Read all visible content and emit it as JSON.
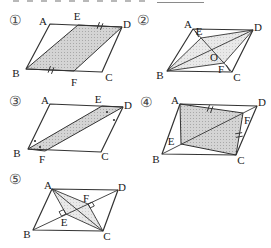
{
  "style": {
    "line_color": "#333333",
    "label_color": "#1a1a1a",
    "number_color": "#4a4a4a",
    "shade_dark_bg": "#d4d4d4",
    "shade_dark_dot": "#a8a8a8",
    "shade_light_bg": "#e9e9e9",
    "shade_light_dot": "#cccccc"
  },
  "top_edge_fragments": {
    "dashes": [
      {
        "x": 13,
        "y": 0,
        "w": 6,
        "h": 2
      },
      {
        "x": 27,
        "y": 0,
        "w": 6,
        "h": 2
      },
      {
        "x": 41,
        "y": 0,
        "w": 6,
        "h": 2
      },
      {
        "x": 55,
        "y": 0,
        "w": 6,
        "h": 2
      },
      {
        "x": 69,
        "y": 0,
        "w": 6,
        "h": 2
      },
      {
        "x": 83,
        "y": 0,
        "w": 6,
        "h": 2
      },
      {
        "x": 97,
        "y": 0,
        "w": 6,
        "h": 2
      },
      {
        "x": 111,
        "y": 0,
        "w": 6,
        "h": 2
      },
      {
        "x": 125,
        "y": 0,
        "w": 6,
        "h": 2
      },
      {
        "x": 139,
        "y": 0,
        "w": 6,
        "h": 2
      }
    ],
    "underline": {
      "x": 157,
      "y": 2,
      "w": 47,
      "h": 1
    }
  },
  "figures": [
    {
      "id": "1",
      "number_label": "①",
      "number_pos": {
        "x": 15,
        "y": 20
      },
      "polygons": [
        {
          "name": "shaded-region",
          "points": "78,25 122,27 74,71 26,69",
          "fill": "dark",
          "stroke": true,
          "sw": 1
        },
        {
          "name": "parallelogram-outline",
          "points": "50,24 122,27 102,72 26,69",
          "fill": "none",
          "stroke": true,
          "sw": 1.2
        }
      ],
      "lines": [],
      "marks": [
        {
          "type": "tick2",
          "x": 100,
          "y": 26,
          "angle": 20
        },
        {
          "type": "tick2",
          "x": 51,
          "y": 70,
          "angle": 20
        }
      ],
      "labels": [
        {
          "text": "A",
          "x": 43,
          "y": 21
        },
        {
          "text": "E",
          "x": 77,
          "y": 16
        },
        {
          "text": "D",
          "x": 127,
          "y": 24
        },
        {
          "text": "B",
          "x": 16,
          "y": 73
        },
        {
          "text": "F",
          "x": 74,
          "y": 82
        },
        {
          "text": "C",
          "x": 109,
          "y": 77
        }
      ]
    },
    {
      "id": "2",
      "number_label": "②",
      "number_pos": {
        "x": 143,
        "y": 20
      },
      "polygons": [
        {
          "name": "shaded-region",
          "points": "167,71 201,38 253,30 224,63",
          "fill": "light",
          "stroke": true,
          "sw": 0.9
        },
        {
          "name": "parallelogram-outline",
          "points": "193,29 253,30 232,72 167,71",
          "fill": "none",
          "stroke": true,
          "sw": 1.2
        }
      ],
      "lines": [
        {
          "name": "diagonal-AC",
          "x1": 193,
          "y1": 29,
          "x2": 232,
          "y2": 72,
          "sw": 0.9
        },
        {
          "name": "diagonal-BD",
          "x1": 167,
          "y1": 71,
          "x2": 253,
          "y2": 30,
          "sw": 0.9
        }
      ],
      "marks": [
        {
          "type": "tick1",
          "x": 197,
          "y": 34,
          "angle": -30
        },
        {
          "type": "tick1",
          "x": 228,
          "y": 68,
          "angle": -30
        }
      ],
      "labels": [
        {
          "text": "A",
          "x": 188,
          "y": 24
        },
        {
          "text": "E",
          "x": 199,
          "y": 31
        },
        {
          "text": "D",
          "x": 258,
          "y": 27
        },
        {
          "text": "O",
          "x": 214,
          "y": 57
        },
        {
          "text": "F",
          "x": 221,
          "y": 69
        },
        {
          "text": "B",
          "x": 160,
          "y": 75
        },
        {
          "text": "C",
          "x": 237,
          "y": 77
        }
      ]
    },
    {
      "id": "3",
      "number_label": "③",
      "number_pos": {
        "x": 15,
        "y": 101
      },
      "polygons": [
        {
          "name": "shaded-region",
          "points": "28,149 102,106 123,107 45,151",
          "fill": "dark",
          "stroke": true,
          "sw": 1
        },
        {
          "name": "parallelogram-outline",
          "points": "50,104 123,107 101,152 28,149",
          "fill": "none",
          "stroke": true,
          "sw": 1.2
        }
      ],
      "lines": [],
      "marks": [
        {
          "type": "dot",
          "x": 35,
          "y": 141
        },
        {
          "type": "dot",
          "x": 40,
          "y": 147
        },
        {
          "type": "dot",
          "x": 107,
          "y": 112
        },
        {
          "type": "dot",
          "x": 114,
          "y": 120
        }
      ],
      "labels": [
        {
          "text": "A",
          "x": 45,
          "y": 100
        },
        {
          "text": "E",
          "x": 98,
          "y": 99
        },
        {
          "text": "D",
          "x": 128,
          "y": 105
        },
        {
          "text": "B",
          "x": 17,
          "y": 153
        },
        {
          "text": "F",
          "x": 42,
          "y": 159
        },
        {
          "text": "C",
          "x": 105,
          "y": 156
        }
      ]
    },
    {
      "id": "4",
      "number_label": "④",
      "number_pos": {
        "x": 146,
        "y": 102
      },
      "polygons": [
        {
          "name": "shaded-region",
          "points": "180,104 243,113 236,155 181,144",
          "fill": "dark",
          "stroke": true,
          "sw": 1
        },
        {
          "name": "parallelogram-outline",
          "points": "180,104 257,106 236,155 162,154",
          "fill": "none",
          "stroke": true,
          "sw": 1.2
        }
      ],
      "lines": [
        {
          "name": "diagonal-BD",
          "x1": 162,
          "y1": 154,
          "x2": 257,
          "y2": 106,
          "sw": 0.9
        }
      ],
      "marks": [
        {
          "type": "tick2",
          "x": 210,
          "y": 109,
          "angle": 20
        },
        {
          "type": "tick2",
          "x": 239,
          "y": 135,
          "angle": 80
        }
      ],
      "labels": [
        {
          "text": "A",
          "x": 175,
          "y": 100
        },
        {
          "text": "D",
          "x": 262,
          "y": 102
        },
        {
          "text": "F",
          "x": 247,
          "y": 120
        },
        {
          "text": "E",
          "x": 171,
          "y": 141
        },
        {
          "text": "B",
          "x": 156,
          "y": 159
        },
        {
          "text": "C",
          "x": 241,
          "y": 160
        }
      ]
    },
    {
      "id": "5",
      "number_label": "⑤",
      "number_pos": {
        "x": 15,
        "y": 179
      },
      "polygons": [
        {
          "name": "shaded-region",
          "points": "52,189 88,204 103,231 66,214",
          "fill": "light",
          "stroke": true,
          "sw": 0.9
        },
        {
          "name": "parallelogram-outline",
          "points": "52,189 118,190 103,231 33,230",
          "fill": "none",
          "stroke": true,
          "sw": 1.2
        }
      ],
      "lines": [
        {
          "name": "diagonal-AC",
          "x1": 52,
          "y1": 189,
          "x2": 103,
          "y2": 231,
          "sw": 0.9
        },
        {
          "name": "diagonal-BD",
          "x1": 33,
          "y1": 230,
          "x2": 118,
          "y2": 190,
          "sw": 0.9
        }
      ],
      "marks": [
        {
          "type": "square",
          "points": "66,214 61.5,216.1 59.1,211.7 63.6,209.6"
        },
        {
          "type": "square",
          "points": "88,204 92.1,202.1 94.3,206.0 90.2,207.9"
        }
      ],
      "labels": [
        {
          "text": "A",
          "x": 48,
          "y": 185
        },
        {
          "text": "D",
          "x": 122,
          "y": 187
        },
        {
          "text": "F",
          "x": 86,
          "y": 198
        },
        {
          "text": "E",
          "x": 64,
          "y": 222
        },
        {
          "text": "B",
          "x": 27,
          "y": 234
        },
        {
          "text": "C",
          "x": 107,
          "y": 236
        }
      ]
    }
  ]
}
